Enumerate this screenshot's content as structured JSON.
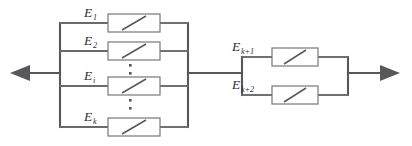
{
  "figure": {
    "type": "circuit-diagram",
    "colors": {
      "wire": "#58585a",
      "element_stroke": "#7d7d80",
      "element_fill": "#ffffff",
      "label_text": "#2e2e30",
      "background": "#ffffff"
    },
    "terminals": {
      "left_arrow": "arrow-left",
      "right_arrow": "arrow-right"
    },
    "blocks": [
      {
        "id": "left-block",
        "branch_count_shown": 4,
        "continuation": true,
        "branches": [
          {
            "id": "branch-e1",
            "symbol": "E",
            "subscript": "1",
            "element": "slash-box"
          },
          {
            "id": "branch-e2",
            "symbol": "E",
            "subscript": "2",
            "element": "slash-box"
          },
          {
            "id": "branch-ei",
            "symbol": "E",
            "subscript": "i",
            "element": "slash-box"
          },
          {
            "id": "branch-ek",
            "symbol": "E",
            "subscript": "k",
            "element": "slash-box"
          }
        ],
        "ellipses": [
          {
            "id": "ellipsis-upper",
            "dots": 2
          },
          {
            "id": "ellipsis-lower",
            "dots": 2
          }
        ]
      },
      {
        "id": "right-block",
        "branch_count_shown": 2,
        "continuation": false,
        "branches": [
          {
            "id": "branch-ek1",
            "symbol": "E",
            "subscript": "k+1",
            "element": "slash-box"
          },
          {
            "id": "branch-ek2",
            "symbol": "E",
            "subscript": "k+2",
            "element": "slash-box"
          }
        ],
        "ellipses": []
      }
    ]
  }
}
